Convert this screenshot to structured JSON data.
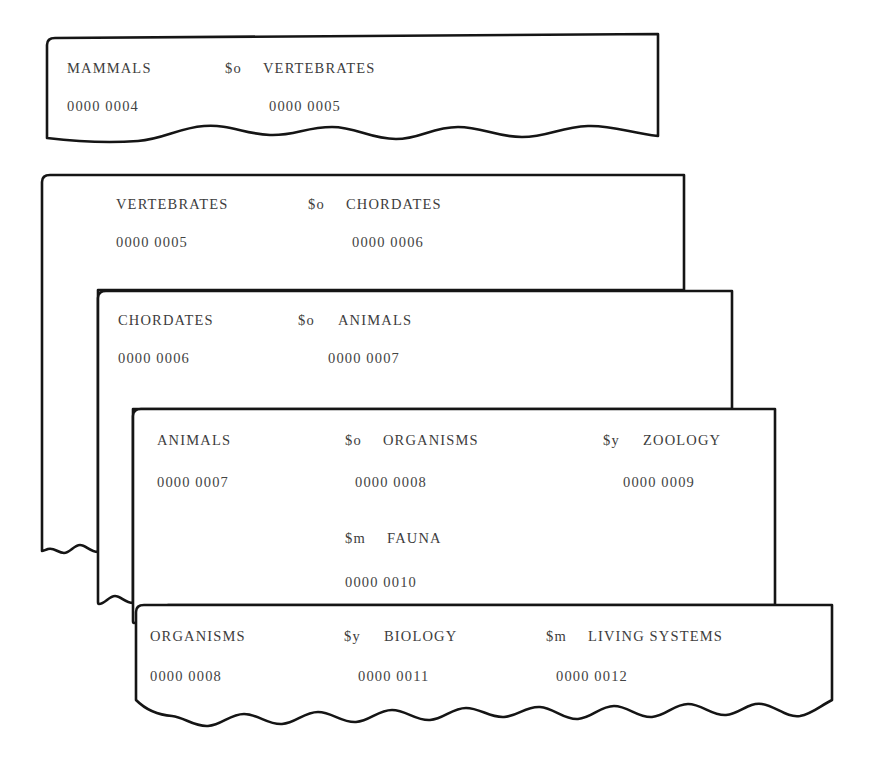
{
  "figure": {
    "name": "stacked-record-cards",
    "background_color": "#ffffff",
    "ink_color": "#1a1a1a",
    "text_color": "#3d3d3d",
    "card_count": 5
  },
  "subfield_codes": {
    "broader": "$o",
    "related": "$y",
    "member": "$m"
  },
  "cards": [
    {
      "id": "card-mammals",
      "index": 1,
      "term": "MAMMALS",
      "term_number": "0000 0004",
      "torn_bottom": true,
      "rows": [
        {
          "id": "row-1",
          "cells": [
            {
              "id": "term",
              "text": "MAMMALS",
              "type": "term",
              "x": 20,
              "y": 0
            },
            {
              "id": "code-1",
              "text": "$o",
              "type": "code",
              "x": 178,
              "y": 0
            },
            {
              "id": "value-1",
              "text": "VERTEBRATES",
              "type": "term",
              "x": 216,
              "y": 0
            }
          ]
        },
        {
          "id": "row-2",
          "cells": [
            {
              "id": "term-num",
              "text": "0000 0004",
              "type": "number",
              "x": 20,
              "y": 38
            },
            {
              "id": "value-1-num",
              "text": "0000 0005",
              "type": "number",
              "x": 222,
              "y": 38
            }
          ]
        }
      ]
    },
    {
      "id": "card-vertebrates",
      "index": 2,
      "term": "VERTEBRATES",
      "term_number": "0000 0005",
      "torn_bottom": false,
      "rows": [
        {
          "id": "row-1",
          "cells": [
            {
              "id": "term",
              "text": "VERTEBRATES",
              "type": "term",
              "x": 74,
              "y": 0
            },
            {
              "id": "code-1",
              "text": "$o",
              "type": "code",
              "x": 266,
              "y": 0
            },
            {
              "id": "value-1",
              "text": "CHORDATES",
              "type": "term",
              "x": 304,
              "y": 0
            }
          ]
        },
        {
          "id": "row-2",
          "cells": [
            {
              "id": "term-num",
              "text": "0000 0005",
              "type": "number",
              "x": 74,
              "y": 38
            },
            {
              "id": "value-1-num",
              "text": "0000 0006",
              "type": "number",
              "x": 310,
              "y": 38
            }
          ]
        }
      ]
    },
    {
      "id": "card-chordates",
      "index": 3,
      "term": "CHORDATES",
      "term_number": "0000 0006",
      "torn_bottom": false,
      "rows": [
        {
          "id": "row-1",
          "cells": [
            {
              "id": "term",
              "text": "CHORDATES",
              "type": "term",
              "x": 20,
              "y": 0
            },
            {
              "id": "code-1",
              "text": "$o",
              "type": "code",
              "x": 200,
              "y": 0
            },
            {
              "id": "value-1",
              "text": "ANIMALS",
              "type": "term",
              "x": 240,
              "y": 0
            }
          ]
        },
        {
          "id": "row-2",
          "cells": [
            {
              "id": "term-num",
              "text": "0000 0006",
              "type": "number",
              "x": 20,
              "y": 38
            },
            {
              "id": "value-1-num",
              "text": "0000 0007",
              "type": "number",
              "x": 230,
              "y": 38
            }
          ]
        }
      ]
    },
    {
      "id": "card-animals",
      "index": 4,
      "term": "ANIMALS",
      "term_number": "0000 0007",
      "torn_bottom": false,
      "rows": [
        {
          "id": "row-1",
          "cells": [
            {
              "id": "term",
              "text": "ANIMALS",
              "type": "term",
              "x": 24,
              "y": 0
            },
            {
              "id": "code-1",
              "text": "$o",
              "type": "code",
              "x": 212,
              "y": 0
            },
            {
              "id": "value-1",
              "text": "ORGANISMS",
              "type": "term",
              "x": 250,
              "y": 0
            },
            {
              "id": "code-2",
              "text": "$y",
              "type": "code",
              "x": 470,
              "y": 0
            },
            {
              "id": "value-2",
              "text": "ZOOLOGY",
              "type": "term",
              "x": 510,
              "y": 0
            }
          ]
        },
        {
          "id": "row-2",
          "cells": [
            {
              "id": "term-num",
              "text": "0000 0007",
              "type": "number",
              "x": 24,
              "y": 42
            },
            {
              "id": "value-1-num",
              "text": "0000 0008",
              "type": "number",
              "x": 222,
              "y": 42
            },
            {
              "id": "value-2-num",
              "text": "0000 0009",
              "type": "number",
              "x": 490,
              "y": 42
            }
          ]
        },
        {
          "id": "row-3",
          "cells": [
            {
              "id": "code-3",
              "text": "$m",
              "type": "code",
              "x": 212,
              "y": 98
            },
            {
              "id": "value-3",
              "text": "FAUNA",
              "type": "term",
              "x": 254,
              "y": 98
            }
          ]
        },
        {
          "id": "row-4",
          "cells": [
            {
              "id": "value-3-num",
              "text": "0000 0010",
              "type": "number",
              "x": 212,
              "y": 142
            }
          ]
        }
      ]
    },
    {
      "id": "card-organisms",
      "index": 5,
      "term": "ORGANISMS",
      "term_number": "0000 0008",
      "torn_bottom": true,
      "rows": [
        {
          "id": "row-1",
          "cells": [
            {
              "id": "term",
              "text": "ORGANISMS",
              "type": "term",
              "x": 14,
              "y": 0
            },
            {
              "id": "code-1",
              "text": "$y",
              "type": "code",
              "x": 208,
              "y": 0
            },
            {
              "id": "value-1",
              "text": "BIOLOGY",
              "type": "term",
              "x": 248,
              "y": 0
            },
            {
              "id": "code-2",
              "text": "$m",
              "type": "code",
              "x": 410,
              "y": 0
            },
            {
              "id": "value-2",
              "text": "LIVING SYSTEMS",
              "type": "term",
              "x": 452,
              "y": 0
            }
          ]
        },
        {
          "id": "row-2",
          "cells": [
            {
              "id": "term-num",
              "text": "0000 0008",
              "type": "number",
              "x": 14,
              "y": 40
            },
            {
              "id": "value-1-num",
              "text": "0000 0011",
              "type": "number",
              "x": 222,
              "y": 40
            },
            {
              "id": "value-2-num",
              "text": "0000 0012",
              "type": "number",
              "x": 420,
              "y": 40
            }
          ]
        }
      ]
    }
  ]
}
